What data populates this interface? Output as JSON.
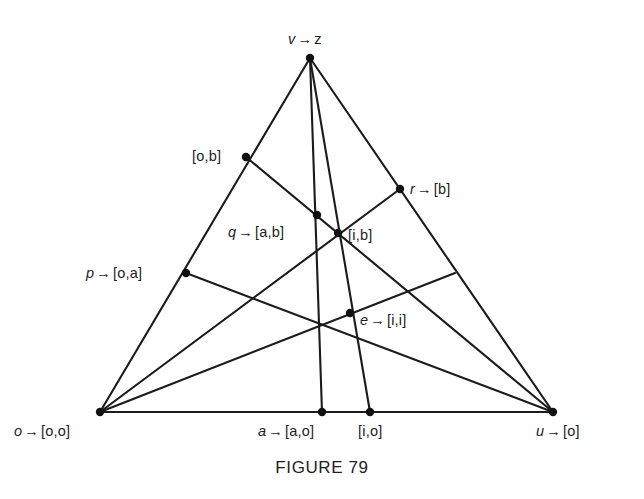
{
  "caption": {
    "text": "FIGURE 79",
    "x": 0,
    "y": 458
  },
  "style": {
    "background": "#ffffff",
    "line_color": "#1b1b1b",
    "dot_color": "#111111",
    "text_color": "#1d1d1d"
  },
  "chart_data": {
    "type": "diagram",
    "title": "FIGURE 79",
    "points": [
      {
        "id": "v",
        "label_sym": "v",
        "label_arrow": "→",
        "label_val": "z",
        "label_full": "v → z",
        "x": 310,
        "y": 58,
        "label_x": 288,
        "label_y": 32,
        "anchor": "left",
        "dot": true
      },
      {
        "id": "ob",
        "label_sym": "",
        "label_arrow": "",
        "label_val": "[o,b]",
        "label_full": "[o,b]",
        "x": 246,
        "y": 157,
        "label_x": 192,
        "label_y": 149,
        "anchor": "left",
        "dot": true
      },
      {
        "id": "r",
        "label_sym": "r",
        "label_arrow": "→",
        "label_val": "[b]",
        "label_full": "r → [b]",
        "x": 400,
        "y": 189,
        "label_x": 410,
        "label_y": 182,
        "anchor": "left",
        "dot": true
      },
      {
        "id": "q",
        "label_sym": "q",
        "label_arrow": "→",
        "label_val": "[a,b]",
        "label_full": "q → [a,b]",
        "x": 317,
        "y": 215,
        "label_x": 228,
        "label_y": 225,
        "anchor": "left",
        "dot": true
      },
      {
        "id": "ib",
        "label_sym": "",
        "label_arrow": "",
        "label_val": "[i,b]",
        "label_full": "[i,b]",
        "x": 338,
        "y": 233,
        "label_x": 348,
        "label_y": 228,
        "anchor": "left",
        "dot": true
      },
      {
        "id": "p",
        "label_sym": "p",
        "label_arrow": "→",
        "label_val": "[o,a]",
        "label_full": "p → [o,a]",
        "x": 186,
        "y": 273,
        "label_x": 86,
        "label_y": 266,
        "anchor": "left",
        "dot": true
      },
      {
        "id": "e",
        "label_sym": "e",
        "label_arrow": "→",
        "label_val": "[i,i]",
        "label_full": "e → [i,i]",
        "x": 350,
        "y": 313,
        "label_x": 360,
        "label_y": 313,
        "anchor": "left",
        "dot": true
      },
      {
        "id": "o",
        "label_sym": "o",
        "label_arrow": "→",
        "label_val": "[o,o]",
        "label_full": "o → [o,o]",
        "x": 100,
        "y": 412,
        "label_x": 14,
        "label_y": 424,
        "anchor": "left",
        "dot": true
      },
      {
        "id": "a",
        "label_sym": "a",
        "label_arrow": "→",
        "label_val": "[a,o]",
        "label_full": "a → [a,o]",
        "x": 322,
        "y": 412,
        "label_x": 258,
        "label_y": 424,
        "anchor": "left",
        "dot": true
      },
      {
        "id": "io",
        "label_sym": "",
        "label_arrow": "",
        "label_val": "[i,o]",
        "label_full": "[i,o]",
        "x": 370,
        "y": 412,
        "label_x": 358,
        "label_y": 424,
        "anchor": "left",
        "dot": true
      },
      {
        "id": "u",
        "label_sym": "u",
        "label_arrow": "→",
        "label_val": "[o]",
        "label_full": "u → [o]",
        "x": 553,
        "y": 412,
        "label_x": 536,
        "label_y": 424,
        "anchor": "left",
        "dot": true
      }
    ],
    "edges": [
      {
        "name": "triangle-side-left",
        "from": "o",
        "to": "v",
        "x1": 100,
        "y1": 412,
        "x2": 310,
        "y2": 58
      },
      {
        "name": "triangle-side-right",
        "from": "v",
        "to": "u",
        "x1": 310,
        "y1": 58,
        "x2": 553,
        "y2": 412
      },
      {
        "name": "triangle-base",
        "from": "o",
        "to": "u",
        "x1": 100,
        "y1": 412,
        "x2": 553,
        "y2": 412
      },
      {
        "name": "cevian-v-a",
        "from": "v",
        "to": "a",
        "x1": 310,
        "y1": 58,
        "x2": 322,
        "y2": 412
      },
      {
        "name": "cevian-v-io",
        "from": "v",
        "to": "io",
        "x1": 310,
        "y1": 58,
        "x2": 370,
        "y2": 412
      },
      {
        "name": "cevian-ob-u",
        "from": "ob",
        "to": "u",
        "x1": 246,
        "y1": 157,
        "x2": 553,
        "y2": 412
      },
      {
        "name": "cevian-p-u",
        "from": "p",
        "to": "u",
        "x1": 186,
        "y1": 273,
        "x2": 553,
        "y2": 412
      },
      {
        "name": "cevian-o-r",
        "from": "o",
        "to": "r",
        "x1": 100,
        "y1": 412,
        "x2": 400,
        "y2": 189
      },
      {
        "name": "cevian-o-rightside",
        "from": "o",
        "to": "rs",
        "x1": 100,
        "y1": 412,
        "x2": 455,
        "y2": 273
      }
    ]
  }
}
